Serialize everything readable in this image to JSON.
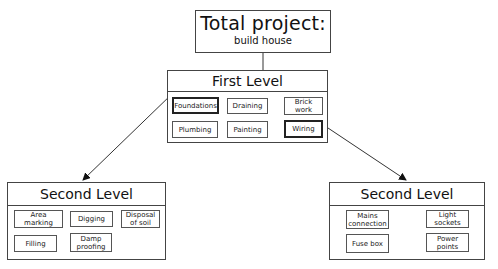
{
  "root": {
    "title": "Total project:",
    "subtitle": "build house"
  },
  "first_level": {
    "title": "First Level",
    "tasks": [
      "Foundations",
      "Draining",
      "Brick work",
      "Plumbing",
      "Painting",
      "Wiring"
    ],
    "highlighted": [
      "Foundations",
      "Wiring"
    ]
  },
  "second_level_left": {
    "title": "Second Level",
    "parent": "Foundations",
    "tasks": [
      "Area marking",
      "Digging",
      "Disposal of soil",
      "Filling",
      "Damp proofing"
    ]
  },
  "second_level_right": {
    "title": "Second Level",
    "parent": "Wiring",
    "tasks": [
      "Mains connection",
      "Light sockets",
      "Fuse box",
      "Power points"
    ]
  }
}
